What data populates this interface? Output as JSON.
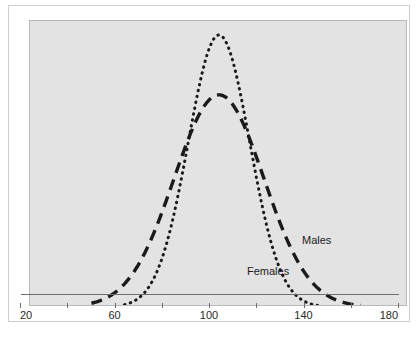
{
  "chart_data": {
    "type": "line",
    "title": "",
    "subtitle": "",
    "xlabel": "",
    "ylabel": "",
    "xlim": [
      20,
      180
    ],
    "ylim": [
      0,
      1
    ],
    "grid": false,
    "legend_position": "inline-annotation",
    "x_ticks": [
      20,
      40,
      60,
      80,
      100,
      120,
      140,
      160,
      180
    ],
    "x_tick_labels": [
      "20",
      "",
      "60",
      "",
      "100",
      "",
      "140",
      "",
      "180"
    ],
    "y_ticks": [],
    "y_tick_labels": [],
    "background_color": "#e3e3e3",
    "line_color": "#1a1a1a",
    "series": [
      {
        "name": "Males",
        "label": "Males",
        "style": "dashed",
        "mean": 100,
        "sd": 19,
        "peak_height": 0.78,
        "x_range": [
          46,
          160
        ],
        "x": [
          46,
          52,
          58,
          64,
          70,
          76,
          82,
          88,
          94,
          100,
          106,
          112,
          118,
          124,
          130,
          136,
          142,
          148,
          154,
          160
        ],
        "y": [
          0.015,
          0.031,
          0.058,
          0.101,
          0.163,
          0.248,
          0.352,
          0.466,
          0.575,
          0.663,
          0.718,
          0.733,
          0.708,
          0.648,
          0.564,
          0.468,
          0.37,
          0.28,
          0.203,
          0.142
        ]
      },
      {
        "name": "Females",
        "label": "Females",
        "style": "dotted",
        "mean": 100,
        "sd": 13,
        "peak_height": 1.0,
        "x_range": [
          60,
          143
        ],
        "x": [
          60,
          65,
          70,
          75,
          80,
          85,
          90,
          95,
          100,
          105,
          110,
          115,
          120,
          125,
          130,
          135,
          140,
          143
        ],
        "y": [
          0.012,
          0.026,
          0.052,
          0.098,
          0.171,
          0.278,
          0.41,
          0.552,
          0.675,
          0.751,
          0.762,
          0.707,
          0.6,
          0.467,
          0.335,
          0.222,
          0.137,
          0.099
        ]
      }
    ],
    "annotations": [
      {
        "text": "Males",
        "x": 100,
        "y": 0
      },
      {
        "text": "Females",
        "x": 100,
        "y": 0
      }
    ]
  },
  "axis": {
    "ticks": [
      {
        "value": "20",
        "label": "20"
      },
      {
        "value": "40",
        "label": ""
      },
      {
        "value": "60",
        "label": "60"
      },
      {
        "value": "80",
        "label": ""
      },
      {
        "value": "100",
        "label": "100"
      },
      {
        "value": "120",
        "label": ""
      },
      {
        "value": "140",
        "label": "140"
      },
      {
        "value": "160",
        "label": ""
      },
      {
        "value": "180",
        "label": "180"
      }
    ],
    "labels": {
      "t20": "20",
      "t60": "60",
      "t100": "100",
      "t140": "140",
      "t180": "180"
    }
  },
  "legend": {
    "males_label": "Males",
    "females_label": "Females"
  }
}
